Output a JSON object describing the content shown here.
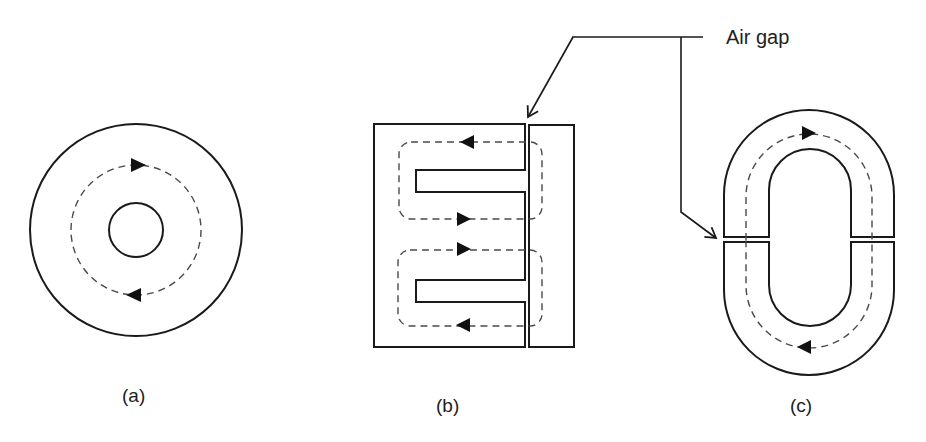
{
  "diagram": {
    "callout": {
      "text": "Air gap"
    },
    "panels": [
      {
        "id": "a",
        "label": "(a)",
        "shape": "toroid",
        "has_air_gap": false
      },
      {
        "id": "b",
        "label": "(b)",
        "shape": "E-I core",
        "has_air_gap": true
      },
      {
        "id": "c",
        "label": "(c)",
        "shape": "split racetrack core",
        "has_air_gap": true
      }
    ],
    "colors": {
      "line": "#1a1a1a",
      "flux_path": "#4a4a4a",
      "background": "#ffffff"
    }
  }
}
